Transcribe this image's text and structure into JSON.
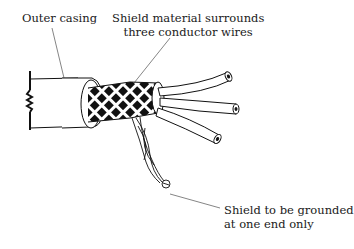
{
  "diagram": {
    "labels": {
      "outer_casing": "Outer casing",
      "shield_line1": "Shield material surrounds",
      "shield_line2": "three conductor wires",
      "ground_line1": "Shield to be grounded",
      "ground_line2": "at one end only"
    },
    "components": [
      "outer casing",
      "braided shield",
      "conductor wire 1",
      "conductor wire 2",
      "conductor wire 3",
      "shield drain/ground lead",
      "ground symbol"
    ],
    "colors": {
      "ink": "#1a1a1a",
      "background": "#ffffff"
    }
  }
}
